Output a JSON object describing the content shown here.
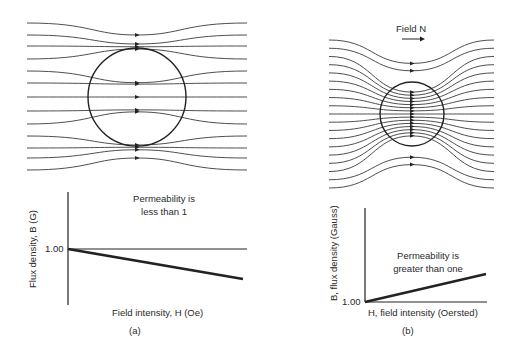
{
  "panel_a": {
    "caption": "(a)",
    "graph": {
      "annotation_line1": "Permeability is",
      "annotation_line2": "less than 1",
      "y_axis_label": "Flux density, B (G)",
      "x_axis_label": "Field intensity, H (Oe)",
      "y_tick": "1.00"
    }
  },
  "panel_b": {
    "caption": "(b)",
    "field_label": "Field N",
    "graph": {
      "annotation_line1": "Permeability is",
      "annotation_line2": "greater than one",
      "y_axis_label": "B, flux density (Gauss)",
      "x_axis_label": "H, field intensity (Oersted)",
      "y_tick": "1.00"
    }
  },
  "chart_data": [
    {
      "type": "line",
      "title": "Permeability is less than 1",
      "xlabel": "Field intensity, H (Oe)",
      "ylabel": "Flux density, B (G)",
      "reference_line": 1.0,
      "series": [
        {
          "name": "reference",
          "x": [
            0,
            1
          ],
          "y": [
            1.0,
            1.0
          ]
        },
        {
          "name": "diamagnetic",
          "x": [
            0,
            1
          ],
          "y": [
            1.0,
            0.75
          ]
        }
      ]
    },
    {
      "type": "line",
      "title": "Permeability is greater than one",
      "xlabel": "H, field intensity (Oersted)",
      "ylabel": "B, flux density (Gauss)",
      "reference_line": 1.0,
      "series": [
        {
          "name": "reference",
          "x": [
            0,
            1
          ],
          "y": [
            1.0,
            1.0
          ]
        },
        {
          "name": "paramagnetic",
          "x": [
            0,
            1
          ],
          "y": [
            1.0,
            1.3
          ]
        }
      ]
    }
  ]
}
